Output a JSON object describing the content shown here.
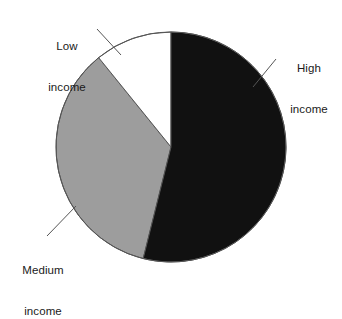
{
  "chart_data": {
    "type": "pie",
    "title": "",
    "subtitle": "",
    "xlabel": "",
    "ylabel": "",
    "grid": false,
    "legend_position": "none",
    "labels_position": "outside-with-leader-lines",
    "categories": [
      "High income",
      "Medium income",
      "Low income"
    ],
    "values": [
      54,
      35,
      11
    ],
    "value_unit": "percent",
    "slices": [
      {
        "label": "High income",
        "label_line1": "High",
        "label_line2": "income",
        "value": 54,
        "start_angle_deg": 0,
        "end_angle_deg": 194,
        "color": "#111111"
      },
      {
        "label": "Medium income",
        "label_line1": "Medium",
        "label_line2": "income",
        "value": 35,
        "start_angle_deg": 194,
        "end_angle_deg": 321,
        "color": "#9d9d9d"
      },
      {
        "label": "Low income",
        "label_line1": "Low",
        "label_line2": "income",
        "value": 11,
        "start_angle_deg": 321,
        "end_angle_deg": 360,
        "color": "#ffffff"
      }
    ],
    "geometry": {
      "center_x": 171,
      "center_y": 147,
      "radius": 115,
      "outline_color": "#555555",
      "outline_width": 1
    }
  },
  "colors": {
    "high_income": "#111111",
    "medium_income": "#9d9d9d",
    "low_income": "#ffffff",
    "outline": "#555555",
    "leader_line": "#555555",
    "text": "#1a1a1a",
    "background": "#ffffff"
  },
  "labels": {
    "low": {
      "line1": "Low",
      "line2": "income"
    },
    "high": {
      "line1": "High",
      "line2": "income"
    },
    "medium": {
      "line1": "Medium",
      "line2": "income"
    }
  }
}
